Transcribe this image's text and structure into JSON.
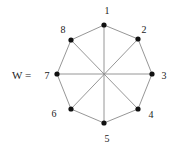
{
  "title_label": "W =",
  "colors": {
    "edge": "#8a8a8a",
    "node": "#111111",
    "label": "#222222",
    "background": "#ffffff"
  },
  "graph": {
    "name": "W",
    "type": "Wagner graph (8-cycle with 4 long diagonals)",
    "center": [
      104,
      75
    ],
    "nodes": [
      {
        "id": "1",
        "label": "1",
        "x": 104,
        "y": 25,
        "lx": 107,
        "ly": 14
      },
      {
        "id": "2",
        "label": "2",
        "x": 138,
        "y": 39,
        "lx": 144,
        "ly": 33
      },
      {
        "id": "3",
        "label": "3",
        "x": 152,
        "y": 74,
        "lx": 164,
        "ly": 79
      },
      {
        "id": "4",
        "label": "4",
        "x": 138,
        "y": 109,
        "lx": 151,
        "ly": 118
      },
      {
        "id": "5",
        "label": "5",
        "x": 104,
        "y": 123,
        "lx": 107,
        "ly": 142
      },
      {
        "id": "6",
        "label": "6",
        "x": 71,
        "y": 109,
        "lx": 54,
        "ly": 117
      },
      {
        "id": "7",
        "label": "7",
        "x": 57,
        "y": 74,
        "lx": 47,
        "ly": 79
      },
      {
        "id": "8",
        "label": "8",
        "x": 71,
        "y": 40,
        "lx": 63,
        "ly": 33
      }
    ],
    "edges": [
      [
        "1",
        "2"
      ],
      [
        "2",
        "3"
      ],
      [
        "3",
        "4"
      ],
      [
        "4",
        "5"
      ],
      [
        "5",
        "6"
      ],
      [
        "6",
        "7"
      ],
      [
        "7",
        "8"
      ],
      [
        "8",
        "1"
      ],
      [
        "1",
        "5"
      ],
      [
        "2",
        "6"
      ],
      [
        "3",
        "7"
      ],
      [
        "4",
        "8"
      ]
    ]
  }
}
